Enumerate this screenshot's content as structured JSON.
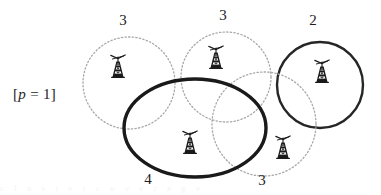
{
  "figure": {
    "width": 381,
    "height": 195,
    "background_color": "#ffffff",
    "param_label": {
      "prefix": "[",
      "variable": "p",
      "equals": " = ",
      "value": "1",
      "suffix": "]",
      "full_text": "[p = 1]"
    },
    "colors": {
      "dotted_stroke": "#a8a8a8",
      "solid_stroke": "#262626",
      "bold_stroke": "#1a1a1a",
      "label_text": "#1d1d1d",
      "tower_fill": "#1a1a1a"
    },
    "regions": [
      {
        "id": "region-left-dotted",
        "label": "3",
        "style": "dotted",
        "shape": "circle",
        "cx": 129,
        "cy": 83,
        "r": 46,
        "stroke_width": 1.3,
        "label_x": 123,
        "label_y": 22
      },
      {
        "id": "region-middle-dotted",
        "label": "3",
        "style": "dotted",
        "shape": "circle",
        "cx": 226,
        "cy": 77,
        "r": 45,
        "stroke_width": 1.3,
        "label_x": 223,
        "label_y": 17
      },
      {
        "id": "region-right-solid",
        "label": "2",
        "style": "solid",
        "shape": "circle",
        "cx": 320,
        "cy": 85,
        "r": 43,
        "stroke_width": 2.4,
        "label_x": 313,
        "label_y": 22
      },
      {
        "id": "region-bottom-right-dotted",
        "label": "3",
        "style": "dotted",
        "shape": "circle",
        "cx": 264,
        "cy": 124,
        "r": 52,
        "stroke_width": 1.3,
        "label_x": 262,
        "label_y": 182
      },
      {
        "id": "region-bold-ellipse",
        "label": "4",
        "style": "bold",
        "shape": "ellipse",
        "cx": 195,
        "cy": 128,
        "rx": 71,
        "ry": 49,
        "stroke_width": 3.4,
        "label_x": 148,
        "label_y": 181
      }
    ],
    "towers": [
      {
        "id": "tower-left",
        "icon": "cell-tower-icon",
        "x": 118,
        "y": 68
      },
      {
        "id": "tower-middle-top",
        "icon": "cell-tower-icon",
        "x": 216,
        "y": 59
      },
      {
        "id": "tower-right",
        "icon": "cell-tower-icon",
        "x": 322,
        "y": 73
      },
      {
        "id": "tower-bottom-left",
        "icon": "cell-tower-icon",
        "x": 190,
        "y": 144
      },
      {
        "id": "tower-bottom-right",
        "icon": "cell-tower-icon",
        "x": 283,
        "y": 149
      }
    ],
    "faint_bottom_artifact": "c  l  u  s  t  e  r    c  o  v  e  r  a  g  e"
  }
}
